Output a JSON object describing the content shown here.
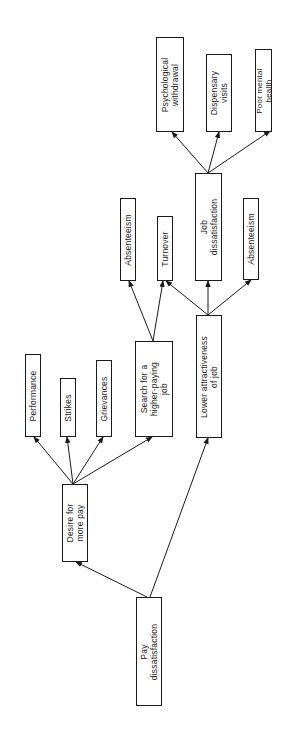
{
  "diagram": {
    "orientation": "rotated 90 degrees counter-clockwise",
    "colors": {
      "line": "#1a1a1a",
      "background": "#ffffff"
    },
    "nodes": {
      "pay_dissatisfaction": {
        "label": "Pay\ndissatisfaction"
      },
      "desire_for_more_pay": {
        "label": "Desire for\nmore pay"
      },
      "performance": {
        "label": "Performance"
      },
      "strikes": {
        "label": "Strikes"
      },
      "grievances": {
        "label": "Grievances"
      },
      "search_higher_paying_job": {
        "label": "Search for a\nhigher-paying\njob"
      },
      "lower_attractiveness": {
        "label": "Lower attractiveness\nof job"
      },
      "absenteeism_1": {
        "label": "Absenteeism"
      },
      "turnover": {
        "label": "Turnover"
      },
      "job_dissatisfaction": {
        "label": "Job\ndissatisfaction"
      },
      "absenteeism_2": {
        "label": "Absenteeism"
      },
      "psychological_withdrawal": {
        "label": "Psychological\nwithdrawal"
      },
      "dispensary_visits": {
        "label": "Dispensary\nvisits"
      },
      "poor_mental_health": {
        "label": "Poor mental\nhealth"
      }
    },
    "edges": [
      {
        "from": "Pay dissatisfaction",
        "to": "Desire for more pay"
      },
      {
        "from": "Pay dissatisfaction",
        "to": "Lower attractiveness of job"
      },
      {
        "from": "Desire for more pay",
        "to": "Performance"
      },
      {
        "from": "Desire for more pay",
        "to": "Strikes"
      },
      {
        "from": "Desire for more pay",
        "to": "Grievances"
      },
      {
        "from": "Desire for more pay",
        "to": "Search for a higher-paying job"
      },
      {
        "from": "Search for a higher-paying job",
        "to": "Absenteeism"
      },
      {
        "from": "Search for a higher-paying job",
        "to": "Turnover"
      },
      {
        "from": "Lower attractiveness of job",
        "to": "Turnover"
      },
      {
        "from": "Lower attractiveness of job",
        "to": "Job dissatisfaction"
      },
      {
        "from": "Lower attractiveness of job",
        "to": "Absenteeism"
      },
      {
        "from": "Job dissatisfaction",
        "to": "Psychological withdrawal"
      },
      {
        "from": "Job dissatisfaction",
        "to": "Dispensary visits"
      },
      {
        "from": "Job dissatisfaction",
        "to": "Poor mental health"
      }
    ]
  }
}
